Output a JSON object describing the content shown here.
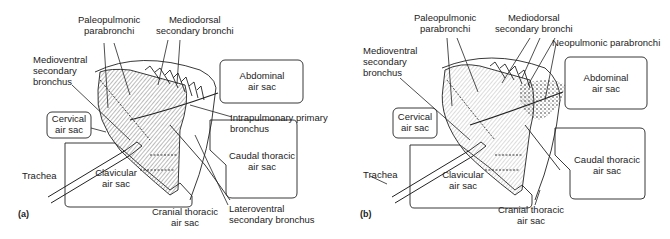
{
  "figure": {
    "panels": [
      {
        "id": "a",
        "label": "(a)",
        "labels": {
          "paleopulmonic_1": "Paleopulmonic",
          "paleopulmonic_2": "parabronchi",
          "mediodorsal_1": "Mediodorsal",
          "mediodorsal_2": "secondary bronchi",
          "medioventral_1": "Medioventral",
          "medioventral_2": "secondary",
          "medioventral_3": "bronchus",
          "abdominal_1": "Abdominal",
          "abdominal_2": "air sac",
          "cervical_1": "Cervical",
          "cervical_2": "air sac",
          "intrapulmonary_1": "Intrapulmonary primary",
          "intrapulmonary_2": "bronchus",
          "caudal_1": "Caudal thoracic",
          "caudal_2": "air sac",
          "trachea": "Trachea",
          "clavicular_1": "Clavicular",
          "clavicular_2": "air sac",
          "cranial_1": "Cranial thoracic",
          "cranial_2": "air sac",
          "lateroventral_1": "Lateroventral",
          "lateroventral_2": "secondary bronchus"
        }
      },
      {
        "id": "b",
        "label": "(b)",
        "labels": {
          "paleopulmonic_1": "Paleopulmonic",
          "paleopulmonic_2": "parabronchi",
          "mediodorsal_1": "Mediodorsal",
          "mediodorsal_2": "secondary bronchi",
          "neopulmonic": "Neopulmonic parabronchi",
          "medioventral_1": "Medioventral",
          "medioventral_2": "secondary",
          "medioventral_3": "bronchus",
          "abdominal_1": "Abdominal",
          "abdominal_2": "air sac",
          "cervical_1": "Cervical",
          "cervical_2": "air sac",
          "caudal_1": "Caudal thoracic",
          "caudal_2": "air sac",
          "trachea": "Trachea",
          "clavicular_1": "Clavicular",
          "clavicular_2": "air sac",
          "cranial_1": "Cranial thoracic",
          "cranial_2": "air sac"
        }
      }
    ]
  }
}
